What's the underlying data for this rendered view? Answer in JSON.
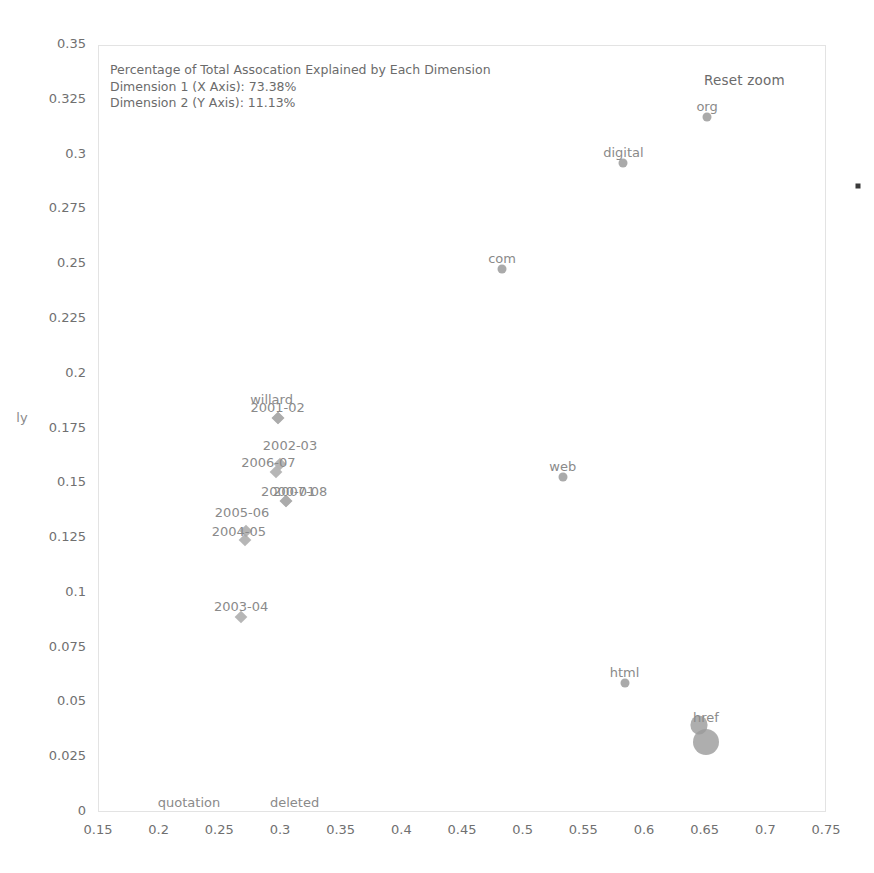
{
  "chart_data": {
    "type": "scatter",
    "title": "",
    "annotation_lines": [
      "Percentage of Total Assocation Explained by Each Dimension",
      "Dimension 1 (X Axis): 73.38%",
      "Dimension 2 (Y Axis): 11.13%"
    ],
    "dimension_1_label": "Dimension 1 (X Axis)",
    "dimension_1_value": "73.38%",
    "dimension_2_label": "Dimension 2 (Y Axis)",
    "dimension_2_value": "11.13%",
    "xlabel": "",
    "ylabel": "",
    "xlim": [
      0.15,
      0.75
    ],
    "ylim": [
      0,
      0.35
    ],
    "grid": false,
    "legend": "none",
    "xticks": [
      "0.15",
      "0.2",
      "0.25",
      "0.3",
      "0.35",
      "0.4",
      "0.45",
      "0.5",
      "0.55",
      "0.6",
      "0.65",
      "0.7",
      "0.75"
    ],
    "yticks": [
      "0.35",
      "0.325",
      "0.3",
      "0.275",
      "0.25",
      "0.225",
      "0.2",
      "0.175",
      "0.15",
      "0.125",
      "0.1",
      "0.075",
      "0.05",
      "0.025",
      "0"
    ],
    "marker_color": "#9b9b9b",
    "label_color": "#8a8a8a",
    "points": [
      {
        "label": "org",
        "x": 0.652,
        "y": 0.317,
        "marker": "circle",
        "label_dx": 0,
        "label_dy": -18
      },
      {
        "label": "digital",
        "x": 0.583,
        "y": 0.296,
        "marker": "circle",
        "label_dx": 0,
        "label_dy": -18
      },
      {
        "label": "com",
        "x": 0.483,
        "y": 0.248,
        "marker": "circle",
        "label_dx": 0,
        "label_dy": -18
      },
      {
        "label": "web",
        "x": 0.533,
        "y": 0.153,
        "marker": "circle",
        "label_dx": 0,
        "label_dy": -18
      },
      {
        "label": "html",
        "x": 0.584,
        "y": 0.059,
        "marker": "circle",
        "label_dx": 0,
        "label_dy": -18
      },
      {
        "label": "href",
        "x": 0.651,
        "y": 0.032,
        "marker": "blob",
        "label_dx": 0,
        "label_dy": -32
      },
      {
        "label": "willard",
        "x": 0.298,
        "y": 0.18,
        "marker": "diamond",
        "label_dx": -6,
        "label_dy": -26
      },
      {
        "label": "2001-02",
        "x": 0.298,
        "y": 0.18,
        "marker": "diamond",
        "label_dx": 0,
        "label_dy": -18
      },
      {
        "label": "2002-03",
        "x": 0.3,
        "y": 0.159,
        "marker": "diamond",
        "label_dx": 10,
        "label_dy": -26
      },
      {
        "label": "2006-07",
        "x": 0.297,
        "y": 0.155,
        "marker": "diamond",
        "label_dx": -8,
        "label_dy": -17
      },
      {
        "label": "2000-01",
        "x": 0.305,
        "y": 0.142,
        "marker": "diamond",
        "label_dx": 2,
        "label_dy": -17
      },
      {
        "label": "2007-08",
        "x": 0.305,
        "y": 0.142,
        "marker": "diamond",
        "label_dx": 14,
        "label_dy": -17
      },
      {
        "label": "2005-06",
        "x": 0.272,
        "y": 0.128,
        "marker": "diamond",
        "label_dx": -4,
        "label_dy": -26
      },
      {
        "label": "2004-05",
        "x": 0.271,
        "y": 0.124,
        "marker": "diamond",
        "label_dx": -6,
        "label_dy": -16
      },
      {
        "label": "2003-04",
        "x": 0.268,
        "y": 0.089,
        "marker": "diamond",
        "label_dx": 0,
        "label_dy": -18
      },
      {
        "label": "quotation",
        "x": 0.225,
        "y": 0.003,
        "marker": "none",
        "label_dx": 0,
        "label_dy": -10
      },
      {
        "label": "deleted",
        "x": 0.312,
        "y": 0.003,
        "marker": "none",
        "label_dx": 0,
        "label_dy": -10
      },
      {
        "label": "ly",
        "x": 0.15,
        "y": 0.18,
        "marker": "none",
        "label_dx": -76,
        "label_dy": -8
      }
    ]
  },
  "controls": {
    "reset_zoom_label": "Reset zoom"
  }
}
